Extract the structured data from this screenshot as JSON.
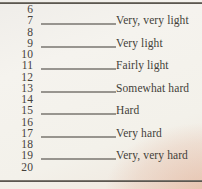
{
  "document": {
    "description": "Borg rating of perceived exertion scale (6-20)",
    "colors": {
      "paper": "#f4f2ed",
      "corner_tint": "#e0a68a",
      "ink": "#45413b",
      "rule": "#4b4741",
      "fill_line": "#3d3933"
    }
  },
  "table": {
    "rows": [
      {
        "value": "6",
        "label": ""
      },
      {
        "value": "7",
        "label": "Very, very light"
      },
      {
        "value": "8",
        "label": ""
      },
      {
        "value": "9",
        "label": "Very light"
      },
      {
        "value": "10",
        "label": ""
      },
      {
        "value": "11",
        "label": "Fairly light"
      },
      {
        "value": "12",
        "label": ""
      },
      {
        "value": "13",
        "label": "Somewhat hard"
      },
      {
        "value": "14",
        "label": ""
      },
      {
        "value": "15",
        "label": "Hard"
      },
      {
        "value": "16",
        "label": ""
      },
      {
        "value": "17",
        "label": "Very hard"
      },
      {
        "value": "18",
        "label": ""
      },
      {
        "value": "19",
        "label": "Very, very hard"
      },
      {
        "value": "20",
        "label": ""
      }
    ]
  }
}
